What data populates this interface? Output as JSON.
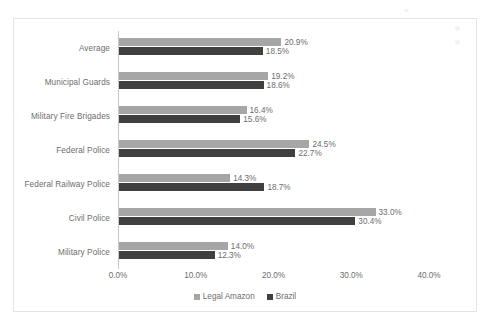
{
  "chart_data": {
    "type": "bar",
    "orientation": "horizontal",
    "title": "",
    "xlabel": "",
    "ylabel": "",
    "xlim": [
      0,
      40
    ],
    "xticks": [
      "0.0%",
      "10.0%",
      "20.0%",
      "30.0%",
      "40.0%"
    ],
    "xtick_values": [
      0,
      10,
      20,
      30,
      40
    ],
    "grid": false,
    "legend_position": "bottom",
    "categories": [
      "Average",
      "Municipal Guards",
      "Military Fire Brigades",
      "Federal Police",
      "Federal Railway Police",
      "Civil Police",
      "Military Police"
    ],
    "series": [
      {
        "name": "Legal Amazon",
        "color": "#a6a6a6",
        "values": [
          20.9,
          19.2,
          16.4,
          24.5,
          14.3,
          33.0,
          14.0
        ],
        "labels": [
          "20.9%",
          "19.2%",
          "16.4%",
          "24.5%",
          "14.3%",
          "33.0%",
          "14.0%"
        ]
      },
      {
        "name": "Brazil",
        "color": "#404040",
        "values": [
          18.5,
          18.6,
          15.6,
          22.7,
          18.7,
          30.4,
          12.3
        ],
        "labels": [
          "18.5%",
          "18.6%",
          "15.6%",
          "22.7%",
          "18.7%",
          "30.4%",
          "12.3%"
        ]
      }
    ]
  },
  "legend": {
    "items": [
      {
        "label": "Legal Amazon",
        "color": "#a6a6a6"
      },
      {
        "label": "Brazil",
        "color": "#404040"
      }
    ]
  },
  "colors": {
    "legal_amazon": "#a6a6a6",
    "brazil": "#404040",
    "axis": "#c9c9c9",
    "text": "#6d6d6d",
    "frame": "#e3e3e3"
  }
}
